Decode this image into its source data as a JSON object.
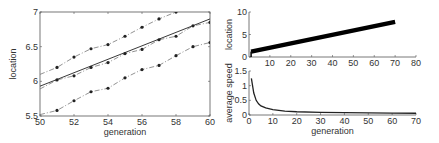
{
  "chart_data": [
    {
      "panel": "left",
      "type": "line",
      "xlabel": "generation",
      "ylabel": "location",
      "xlim": [
        50,
        60
      ],
      "ylim": [
        5.5,
        7
      ],
      "xticks": [
        50,
        52,
        54,
        56,
        58,
        60
      ],
      "yticks": [
        5.5,
        6,
        6.5,
        7
      ],
      "ytick_labels": [
        "5.5",
        "6",
        "6.5",
        "7"
      ],
      "grid": false,
      "legend": null,
      "series": [
        {
          "name": "upper",
          "style": "dash-dot with markers",
          "x": [
            50,
            51,
            52,
            53,
            54,
            55,
            56,
            57,
            58
          ],
          "values": [
            6.1,
            6.2,
            6.35,
            6.47,
            6.53,
            6.65,
            6.78,
            6.9,
            7.0
          ]
        },
        {
          "name": "middle",
          "style": "dash-dot with markers",
          "x": [
            50,
            51,
            52,
            53,
            54,
            55,
            56,
            57,
            58,
            59,
            60
          ],
          "values": [
            5.89,
            6.02,
            6.08,
            6.2,
            6.27,
            6.4,
            6.46,
            6.6,
            6.65,
            6.8,
            6.85
          ]
        },
        {
          "name": "lower",
          "style": "dash-dot with markers",
          "x": [
            50,
            51,
            52,
            53,
            54,
            55,
            56,
            57,
            58,
            59,
            60
          ],
          "values": [
            5.52,
            5.58,
            5.72,
            5.85,
            5.9,
            6.05,
            6.17,
            6.23,
            6.37,
            6.5,
            6.56
          ]
        },
        {
          "name": "fit",
          "style": "solid",
          "x": [
            50,
            60
          ],
          "values": [
            5.93,
            6.9
          ]
        }
      ]
    },
    {
      "panel": "right-top",
      "type": "line",
      "xlabel": "",
      "ylabel": "location",
      "xlim": [
        0,
        80
      ],
      "ylim": [
        0,
        10
      ],
      "xticks": [
        10,
        20,
        30,
        40,
        50,
        60,
        70,
        80
      ],
      "yticks": [
        0,
        5,
        10
      ],
      "grid": false,
      "series": [
        {
          "name": "location band",
          "style": "thick solid",
          "x": [
            1,
            70
          ],
          "values": [
            1.2,
            7.8
          ]
        }
      ]
    },
    {
      "panel": "right-bottom",
      "type": "line",
      "xlabel": "generation",
      "ylabel": "average speed",
      "xlim": [
        0,
        70
      ],
      "ylim": [
        0,
        1.5
      ],
      "xticks": [
        0,
        10,
        20,
        30,
        40,
        50,
        60,
        70
      ],
      "yticks": [
        0,
        0.5,
        1,
        1.5
      ],
      "ytick_labels": [
        "0",
        "0.5",
        "1",
        "1.5"
      ],
      "grid": false,
      "series": [
        {
          "name": "average speed",
          "style": "solid",
          "x": [
            1,
            2,
            3,
            4,
            5,
            7,
            10,
            15,
            20,
            30,
            40,
            50,
            60,
            70
          ],
          "values": [
            1.25,
            0.75,
            0.5,
            0.38,
            0.31,
            0.24,
            0.18,
            0.13,
            0.11,
            0.09,
            0.08,
            0.07,
            0.065,
            0.06
          ]
        }
      ]
    }
  ]
}
